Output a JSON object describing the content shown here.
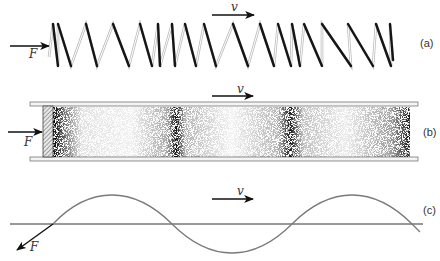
{
  "panels": [
    {
      "id": "a",
      "label": "(a)",
      "description": "Compressed spring with longitudinal wave",
      "force_label": "F",
      "velocity_label": "v",
      "spring_top_peaks_x": [
        53,
        58,
        86,
        113,
        140,
        158,
        172,
        185,
        204,
        233,
        260,
        278,
        292,
        304,
        322,
        348,
        376,
        390
      ],
      "spring_bottom_valleys_x": [
        58,
        71,
        97,
        129,
        152,
        160,
        175,
        196,
        216,
        248,
        274,
        291,
        300,
        322,
        351,
        373,
        391
      ]
    },
    {
      "id": "b",
      "label": "(b)",
      "description": "Tube with piston creating compressions in gas",
      "force_label": "F",
      "velocity_label": "v",
      "compression_bands_x": [
        60,
        172,
        293,
        405
      ]
    },
    {
      "id": "c",
      "label": "(c)",
      "description": "Transverse wave on a string",
      "force_label": "F",
      "velocity_label": "v"
    }
  ],
  "colors": {
    "ink": "#1a1a1a",
    "spring_light": "#c8c8c8",
    "wave": "#7a7a7a",
    "rail": "#888888"
  }
}
